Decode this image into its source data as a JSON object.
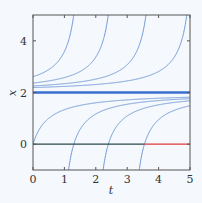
{
  "chart_data": {
    "type": "line",
    "title": "",
    "xlabel": "t",
    "ylabel": "x",
    "xlim": [
      0,
      5
    ],
    "ylim": [
      -1,
      5
    ],
    "xticks": [
      0,
      1,
      2,
      3,
      4,
      5
    ],
    "yticks": [
      0,
      2,
      4
    ],
    "xtick_labels": [
      "0",
      "1",
      "2",
      "3",
      "4",
      "5"
    ],
    "ytick_labels": [
      "0",
      "2",
      "4"
    ],
    "grid": false,
    "legend": null,
    "equation_hint": "solution curves of the form x = 2 - 1/(t + C)",
    "equilibrium": {
      "x": 2,
      "color": "#3a6fd0",
      "style": "thick"
    },
    "zero_line": {
      "x": 0,
      "segments": [
        {
          "t_start": 0,
          "t_end": 3.55,
          "color": "#2a4a4a"
        },
        {
          "t_start": 3.55,
          "t_end": 5,
          "color": "#e03a3a"
        }
      ]
    },
    "series": [
      {
        "name": "upper-1",
        "C": -1.63,
        "x0": 2.61,
        "exits_top_at_t": 1.3
      },
      {
        "name": "upper-2",
        "C": -2.73,
        "x0": 2.37,
        "exits_top_at_t": 2.4
      },
      {
        "name": "upper-3",
        "C": -3.93,
        "x0": 2.25,
        "exits_top_at_t": 3.6
      },
      {
        "name": "upper-4",
        "C": -5.23,
        "x0": 2.19,
        "exits_top_at_t": 4.9
      },
      {
        "name": "lower-0",
        "C": 0.5,
        "x0": 0.0,
        "x_at_t5": 1.82
      },
      {
        "name": "lower-1",
        "C": -0.8,
        "crosses_zero_at_t": 1.3,
        "x_at_t5": 1.76
      },
      {
        "name": "lower-2",
        "C": -1.9,
        "crosses_zero_at_t": 2.4,
        "x_at_t5": 1.68
      },
      {
        "name": "lower-3",
        "C": -3.05,
        "crosses_zero_at_t": 3.55,
        "x_at_t5": 1.49
      }
    ],
    "curve_color": "#6e98d8"
  },
  "colors": {
    "background": "#f5f8fc",
    "frame": "#555555",
    "curve": "#6e98d8",
    "equilibrium": "#3a6fd0",
    "zero_dark": "#2a4a4a",
    "zero_red": "#e03a3a"
  }
}
